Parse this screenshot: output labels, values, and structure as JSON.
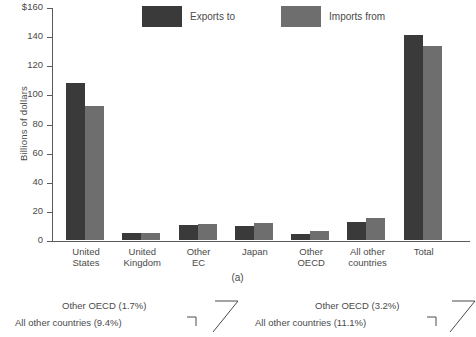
{
  "chart_data": {
    "type": "bar",
    "title": "",
    "subtitle": "",
    "xlabel": "",
    "ylabel": "Billions of dollars",
    "ylim": [
      0,
      160
    ],
    "ytick_labels": [
      "$160",
      "140",
      "120",
      "100",
      "80",
      "60",
      "40",
      "20",
      "0"
    ],
    "ytick_values": [
      160,
      140,
      120,
      100,
      80,
      60,
      40,
      20,
      0
    ],
    "grid": false,
    "legend_position": "top-center",
    "categories": [
      "United States",
      "United Kingdom",
      "Other EC",
      "Japan",
      "Other OECD",
      "All other countries",
      "Total"
    ],
    "category_lines": [
      [
        "United",
        "States"
      ],
      [
        "United",
        "Kingdom"
      ],
      [
        "Other",
        "EC"
      ],
      [
        "Japan",
        ""
      ],
      [
        "Other",
        "OECD"
      ],
      [
        "All other",
        "countries"
      ],
      [
        "Total",
        ""
      ]
    ],
    "series": [
      {
        "name": "Exports to",
        "color": "#3a3a3a",
        "values": [
          108,
          4.5,
          10.5,
          9.5,
          4.0,
          12.5,
          141
        ]
      },
      {
        "name": "Imports from",
        "color": "#6e6e6e",
        "values": [
          92,
          5.0,
          11.0,
          11.5,
          6.0,
          15.0,
          133
        ]
      }
    ]
  },
  "legend": {
    "items": [
      {
        "label": "Exports to",
        "color": "#3a3a3a"
      },
      {
        "label": "Imports from",
        "color": "#6e6e6e"
      }
    ]
  },
  "captions": {
    "figure_a": "(a)"
  },
  "figure_b": {
    "callouts": [
      {
        "label": "Other OECD (1.7%)",
        "side": "left"
      },
      {
        "label": "All other countries (9.4%)",
        "side": "left"
      },
      {
        "label": "Other OECD (3.2%)",
        "side": "right"
      },
      {
        "label": "All other countries (11.1%)",
        "side": "right"
      }
    ]
  },
  "colors": {
    "exports": "#3a3a3a",
    "imports": "#6e6e6e",
    "axis": "#5a5a5a",
    "text": "#4a4a4a",
    "background": "#ffffff"
  }
}
